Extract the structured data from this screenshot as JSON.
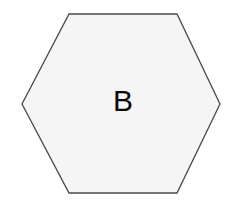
{
  "canvas": {
    "width": 243,
    "height": 206,
    "background_color": "#ffffff"
  },
  "diagram": {
    "title": "",
    "shape": {
      "name": "hexagon",
      "label": "B",
      "label_color": "#0a0a0a",
      "label_font_size": 30,
      "fill_color": "#f5f5f5",
      "stroke_color": "#4a4a4a",
      "stroke_width": 1.3,
      "orientation": "flat-top",
      "points": "69,14 177,14 220,104 177,193 69,193 22,104",
      "vertices": [
        {
          "id": "top-left",
          "x": 69,
          "y": 14
        },
        {
          "id": "top-right",
          "x": 177,
          "y": 14
        },
        {
          "id": "right",
          "x": 220,
          "y": 104
        },
        {
          "id": "bottom-right",
          "x": 177,
          "y": 193
        },
        {
          "id": "bottom-left",
          "x": 69,
          "y": 193
        },
        {
          "id": "left",
          "x": 22,
          "y": 104
        }
      ],
      "label_position": {
        "x": 123,
        "y": 100
      }
    }
  }
}
